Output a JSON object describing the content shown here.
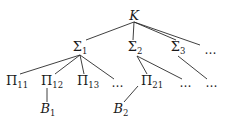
{
  "diagram": {
    "type": "tree",
    "nodes": [
      {
        "id": "K",
        "base": "K",
        "sub": "",
        "italic": true,
        "x": 134,
        "y": 15
      },
      {
        "id": "S1",
        "base": "Σ",
        "sub": "1",
        "italic": false,
        "x": 80,
        "y": 48
      },
      {
        "id": "S2",
        "base": "Σ",
        "sub": "2",
        "italic": false,
        "x": 135,
        "y": 48
      },
      {
        "id": "S3",
        "base": "Σ",
        "sub": "3",
        "italic": false,
        "x": 178,
        "y": 48
      },
      {
        "id": "D0",
        "base": "…",
        "sub": "",
        "italic": false,
        "x": 211,
        "y": 50
      },
      {
        "id": "P11",
        "base": "Π",
        "sub": "11",
        "italic": false,
        "x": 17,
        "y": 82
      },
      {
        "id": "P12",
        "base": "Π",
        "sub": "12",
        "italic": false,
        "x": 52,
        "y": 82
      },
      {
        "id": "P13",
        "base": "Π",
        "sub": "13",
        "italic": false,
        "x": 88,
        "y": 82
      },
      {
        "id": "D1",
        "base": "…",
        "sub": "",
        "italic": false,
        "x": 118,
        "y": 83
      },
      {
        "id": "P21",
        "base": "Π",
        "sub": "21",
        "italic": false,
        "x": 152,
        "y": 82
      },
      {
        "id": "D2",
        "base": "…",
        "sub": "",
        "italic": false,
        "x": 186,
        "y": 83
      },
      {
        "id": "D3",
        "base": "…",
        "sub": "",
        "italic": false,
        "x": 212,
        "y": 83
      },
      {
        "id": "B1",
        "base": "B",
        "sub": "1",
        "italic": true,
        "x": 48,
        "y": 110
      },
      {
        "id": "B2",
        "base": "B",
        "sub": "2",
        "italic": true,
        "x": 121,
        "y": 110
      }
    ],
    "edges": [
      {
        "from": "K",
        "to": "S1",
        "x1": 134,
        "y1": 22,
        "x2": 86,
        "y2": 40
      },
      {
        "from": "K",
        "to": "S2",
        "x1": 134,
        "y1": 22,
        "x2": 133,
        "y2": 40
      },
      {
        "from": "K",
        "to": "S3",
        "x1": 134,
        "y1": 22,
        "x2": 176,
        "y2": 40
      },
      {
        "from": "K",
        "to": "D0",
        "x1": 134,
        "y1": 22,
        "x2": 200,
        "y2": 45
      },
      {
        "from": "S1",
        "to": "P11",
        "x1": 80,
        "y1": 55,
        "x2": 20,
        "y2": 74
      },
      {
        "from": "S1",
        "to": "P12",
        "x1": 80,
        "y1": 55,
        "x2": 55,
        "y2": 74
      },
      {
        "from": "S1",
        "to": "P13",
        "x1": 80,
        "y1": 55,
        "x2": 84,
        "y2": 74
      },
      {
        "from": "S1",
        "to": "D1",
        "x1": 80,
        "y1": 55,
        "x2": 114,
        "y2": 79
      },
      {
        "from": "S2",
        "to": "P21",
        "x1": 137,
        "y1": 56,
        "x2": 147,
        "y2": 74
      },
      {
        "from": "S2",
        "to": "D2",
        "x1": 137,
        "y1": 56,
        "x2": 182,
        "y2": 79
      },
      {
        "from": "S3",
        "to": "D3",
        "x1": 178,
        "y1": 56,
        "x2": 207,
        "y2": 79
      },
      {
        "from": "P12",
        "to": "B1",
        "x1": 47,
        "y1": 88,
        "x2": 47,
        "y2": 102
      },
      {
        "from": "P21",
        "to": "B2",
        "x1": 138,
        "y1": 86,
        "x2": 124,
        "y2": 102
      }
    ],
    "line_color": "#2a2a2a",
    "text_color": "#1a1a1a"
  }
}
